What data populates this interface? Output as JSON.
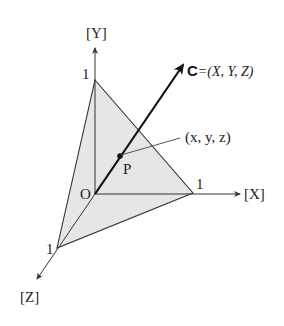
{
  "diagram": {
    "type": "3d-coordinate-plane",
    "colors": {
      "background": "#ffffff",
      "plane_fill": "#e6e6e6",
      "line": "#333333",
      "vector": "#111111"
    },
    "axes": {
      "x": {
        "label": "[X]",
        "tick": "1"
      },
      "y": {
        "label": "[Y]",
        "tick": "1"
      },
      "z": {
        "label": "[Z]",
        "tick": "1"
      }
    },
    "origin": {
      "label": "O"
    },
    "vector": {
      "name": "C",
      "equals": "=(X, Y, Z)"
    },
    "point": {
      "label": "P",
      "coords": "(x, y, z)"
    }
  }
}
